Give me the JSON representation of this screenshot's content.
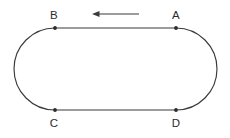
{
  "diagram": {
    "title": "Stadium-shaped closed track with labelled points and direction arrow",
    "canvas": {
      "width": 230,
      "height": 138,
      "background": "#ffffff"
    },
    "colors": {
      "stroke": "#3a3a3a",
      "dot": "#2b2b2b",
      "label": "#2b2b2b",
      "arrow": "#3a3a3a"
    },
    "shape": {
      "kind": "stadium",
      "straight_top_y": 28,
      "straight_bottom_y": 110,
      "straight_left_x": 55,
      "straight_right_x": 176,
      "cap_radius": 41,
      "left_extent_x": 13,
      "right_extent_x": 218
    },
    "points": [
      {
        "id": "B",
        "label": "B",
        "x": 55,
        "y": 28,
        "label_x": 54,
        "label_y": 19,
        "label_position": "above"
      },
      {
        "id": "A",
        "label": "A",
        "x": 176,
        "y": 28,
        "label_x": 176,
        "label_y": 19,
        "label_position": "above"
      },
      {
        "id": "C",
        "label": "C",
        "x": 55,
        "y": 110,
        "label_x": 54,
        "label_y": 127,
        "label_position": "below"
      },
      {
        "id": "D",
        "label": "D",
        "x": 176,
        "y": 110,
        "label_x": 176,
        "label_y": 127,
        "label_position": "below"
      }
    ],
    "arrow": {
      "name": "direction-arrow",
      "direction": "left",
      "meaning": "motion from A toward B",
      "tail_x": 139,
      "tip_x": 92,
      "y": 14,
      "head_length": 7,
      "head_half_width": 3
    }
  }
}
